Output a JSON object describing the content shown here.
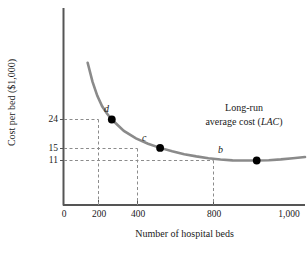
{
  "chart_data": {
    "type": "line",
    "title": "",
    "xlabel": "Number of hospital beds",
    "ylabel": "Cost per bed ($1,000)",
    "xlim": [
      0,
      1000
    ],
    "ylim": [
      0,
      42
    ],
    "grid": false,
    "legend_position": "inside-right",
    "series": [
      {
        "name": "Long-run average cost (LAC)",
        "x": [
          100,
          120,
          140,
          160,
          180,
          200,
          250,
          300,
          350,
          400,
          450,
          500,
          550,
          600,
          650,
          700,
          750,
          800,
          850,
          900,
          950,
          1000
        ],
        "y": [
          42.0,
          36.0,
          31.5,
          28.2,
          25.9,
          24.0,
          20.4,
          18.0,
          16.3,
          15.0,
          13.9,
          13.0,
          12.3,
          11.7,
          11.3,
          11.05,
          11.0,
          11.0,
          11.1,
          11.35,
          11.7,
          12.1
        ]
      }
    ],
    "points": [
      {
        "label": "d",
        "x": 200,
        "y": 24
      },
      {
        "label": "c",
        "x": 400,
        "y": 15
      },
      {
        "label": "b",
        "x": 800,
        "y": 11
      }
    ],
    "x_ticks": [
      {
        "value": 0,
        "label": "0"
      },
      {
        "value": 200,
        "label": "200"
      },
      {
        "value": 400,
        "label": "400"
      },
      {
        "value": 800,
        "label": "800"
      },
      {
        "value": 1000,
        "label": "1,000"
      }
    ],
    "y_ticks": [
      {
        "value": 11,
        "label": "11"
      },
      {
        "value": 15,
        "label": "15"
      },
      {
        "value": 24,
        "label": "24"
      }
    ],
    "annotations": [
      {
        "line1": "Long-run",
        "line2_prefix": "average cost (",
        "line2_italic": "LAC",
        "line2_suffix": ")"
      }
    ],
    "colors": {
      "curve": "#8a8a8a",
      "axis": "#555555",
      "marker": "#000000",
      "guide": "#8c8c8c",
      "text": "#1a1a1a"
    }
  },
  "chart": {
    "ylabel": "Cost per bed ($1,000)",
    "xlabel": "Number of hospital beds",
    "annotation_line1": "Long-run",
    "annotation_line2_prefix": "average cost (",
    "annotation_line2_italic": "LAC",
    "annotation_line2_suffix": ")",
    "x_tick_0": "0",
    "x_tick_200": "200",
    "x_tick_400": "400",
    "x_tick_800": "800",
    "x_tick_1000": "1,000",
    "y_tick_11": "11",
    "y_tick_15": "15",
    "y_tick_24": "24",
    "point_d": "d",
    "point_c": "c",
    "point_b": "b"
  }
}
